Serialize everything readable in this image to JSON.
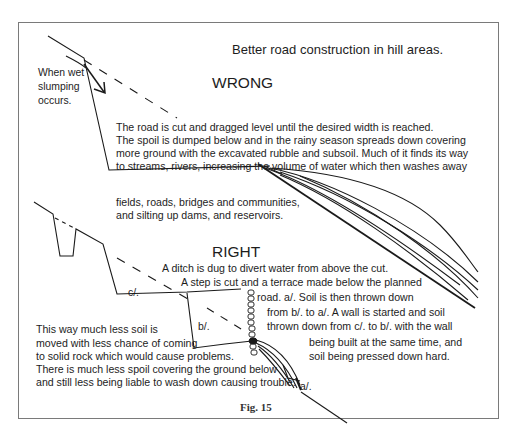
{
  "title": "Better road construction in hill areas.",
  "wrong": {
    "heading": "WRONG",
    "slump_note": [
      "When wet",
      "slumping",
      "occurs."
    ],
    "description": [
      "The road is cut and dragged level until the desired width is reached.",
      "The spoil is dumped below and in the rainy season spreads down covering",
      " more ground with the excavated rubble and subsoil. Much of it finds its way",
      "to streams, rivers, increasing the volume of water which then washes away"
    ],
    "consequences": [
      " fields, roads, bridges and communities,",
      "and silting up dams,  and  reservoirs."
    ]
  },
  "right": {
    "heading": "RIGHT",
    "steps": [
      "A ditch is dug to divert water from above the cut.",
      "A step is cut and a terrace made below the planned",
      "road. a/.     Soil is then thrown down",
      "from b/. to a/. A wall is started and soil",
      "thrown down from c/. to b/. with the wall",
      "being built at the same time, and",
      "soil being pressed down hard."
    ],
    "labels": {
      "a": "a/.",
      "b": "b/.",
      "c": "c/."
    },
    "benefits": [
      "This way much less soil is",
      " moved with less chance of coming",
      "to solid rock which would cause problems.",
      "There is much less spoil covering the ground below",
      "and still less being liable to wash down causing trouble."
    ]
  },
  "caption": "Fig. 15"
}
